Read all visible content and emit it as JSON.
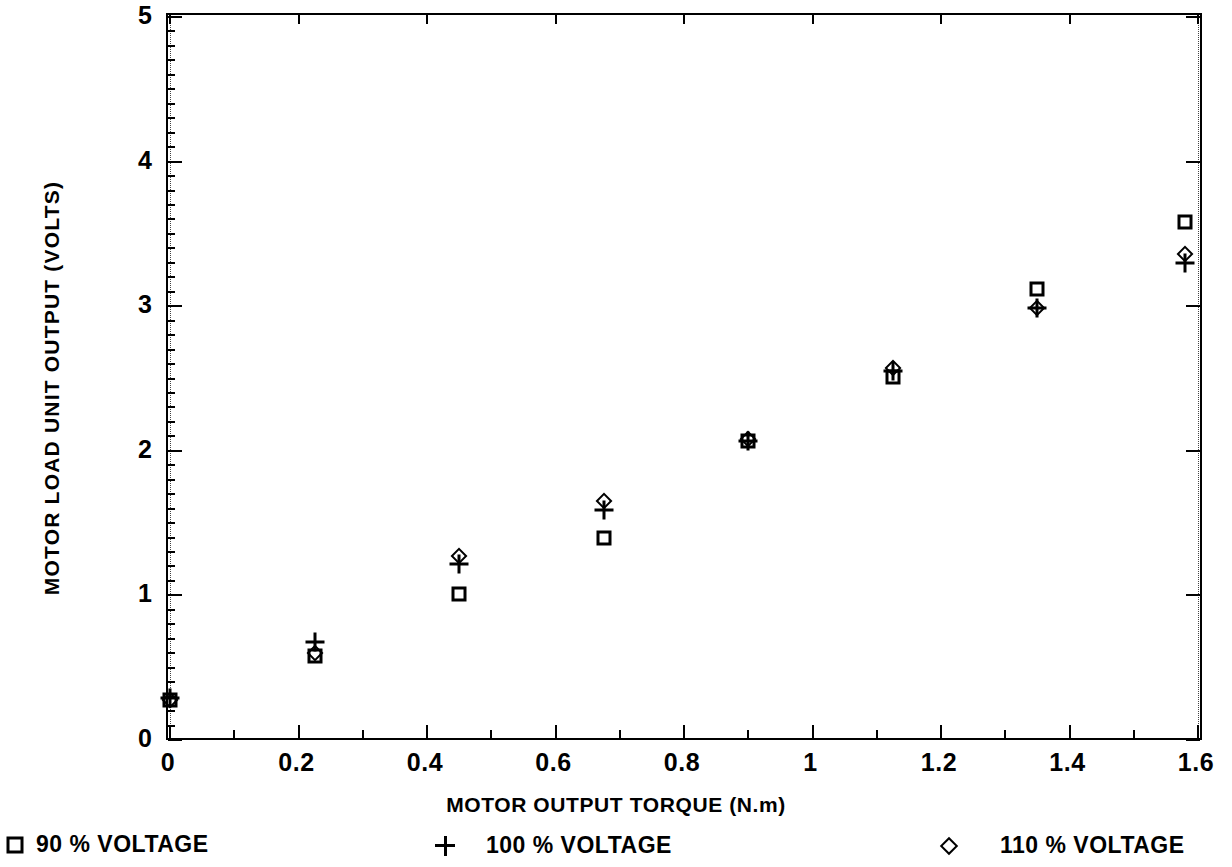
{
  "chart_data": {
    "type": "scatter",
    "title": "",
    "xlabel": "MOTOR OUTPUT TORQUE (N.m)",
    "ylabel": "MOTOR LOAD UNIT OUTPUT (VOLTS)",
    "xlim": [
      0,
      1.6
    ],
    "ylim": [
      0,
      5
    ],
    "xticks": [
      0,
      0.2,
      0.4,
      0.6,
      0.8,
      1,
      1.2,
      1.4,
      1.6
    ],
    "xticklabels": [
      "0",
      "0.2",
      "0.4",
      "0.6",
      "0.8",
      "1",
      "1.2",
      "1.4",
      "1.6"
    ],
    "xminorticks": [
      0.1,
      0.3,
      0.5,
      0.7,
      0.9,
      1.1,
      1.3,
      1.5
    ],
    "yticks": [
      0,
      1,
      2,
      3,
      4,
      5
    ],
    "yticklabels": [
      "0",
      "1",
      "2",
      "3",
      "4",
      "5"
    ],
    "grid": false,
    "legend_position": "below",
    "series": [
      {
        "name": "90 % VOLTAGE",
        "marker": "square",
        "x": [
          0,
          0.225,
          0.45,
          0.675,
          0.9,
          1.125,
          1.35,
          1.58
        ],
        "y": [
          0.28,
          0.58,
          1.01,
          1.4,
          2.07,
          2.51,
          3.12,
          3.58
        ]
      },
      {
        "name": "100 % VOLTAGE",
        "marker": "plus",
        "x": [
          0,
          0.225,
          0.45,
          0.675,
          0.9,
          1.125,
          1.35,
          1.58
        ],
        "y": [
          0.29,
          0.68,
          1.22,
          1.59,
          2.07,
          2.55,
          2.99,
          3.3
        ]
      },
      {
        "name": "110 % VOLTAGE",
        "marker": "diamond",
        "x": [
          0,
          0.225,
          0.45,
          0.675,
          0.9,
          1.125,
          1.35,
          1.58
        ],
        "y": [
          0.28,
          0.6,
          1.27,
          1.65,
          2.08,
          2.57,
          2.99,
          3.36
        ]
      }
    ]
  },
  "legend": {
    "entries": [
      {
        "marker": "square",
        "label": "90 % VOLTAGE"
      },
      {
        "marker": "plus",
        "label": "100 % VOLTAGE"
      },
      {
        "marker": "diamond",
        "label": "110 % VOLTAGE"
      }
    ]
  }
}
